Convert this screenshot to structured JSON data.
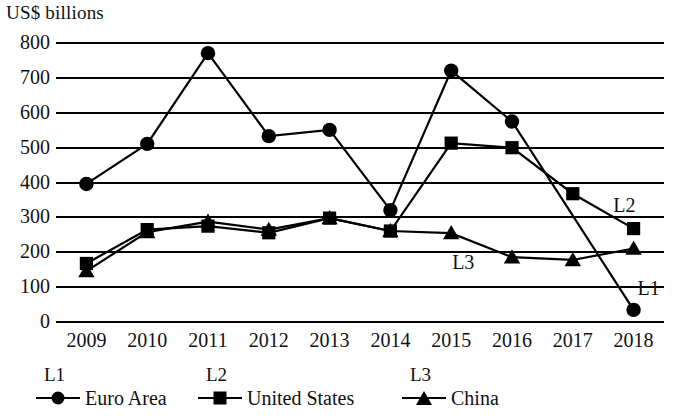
{
  "chart_data": {
    "type": "line",
    "title": "",
    "ylabel": "US$ billions",
    "xlabel": "",
    "ylim": [
      0,
      800
    ],
    "ytick_step": 100,
    "yticks": [
      "0",
      "100",
      "200",
      "300",
      "400",
      "500",
      "600",
      "700",
      "800"
    ],
    "grid": true,
    "legend_position": "below-axis",
    "categories": [
      "2009",
      "2010",
      "2011",
      "2012",
      "2013",
      "2014",
      "2015",
      "2016",
      "2017",
      "2018"
    ],
    "series": [
      {
        "name": "Euro Area",
        "tag": "L1",
        "marker": "circle",
        "values": [
          393,
          508,
          768,
          530,
          548,
          318,
          718,
          572,
          null,
          32
        ]
      },
      {
        "name": "United States",
        "tag": "L2",
        "marker": "square",
        "values": [
          165,
          262,
          272,
          253,
          295,
          258,
          510,
          497,
          365,
          265
        ]
      },
      {
        "name": "China",
        "tag": "L3",
        "marker": "triangle",
        "values": [
          143,
          255,
          285,
          262,
          295,
          258,
          252,
          183,
          175,
          208
        ]
      }
    ],
    "annotations": [
      {
        "text": "L1",
        "x": 2018,
        "y": 95
      },
      {
        "text": "L2",
        "x": 2017.6,
        "y": 333
      },
      {
        "text": "L3",
        "x": 2014.95,
        "y": 168
      }
    ],
    "colors": {
      "ink": "#000000",
      "background": "#ffffff"
    }
  },
  "legend": {
    "entries": [
      {
        "tag": "L1",
        "label": "Euro Area",
        "marker": "circle-marker-icon"
      },
      {
        "tag": "L2",
        "label": "United States",
        "marker": "square-marker-icon"
      },
      {
        "tag": "L3",
        "label": "China",
        "marker": "triangle-marker-icon"
      }
    ]
  }
}
